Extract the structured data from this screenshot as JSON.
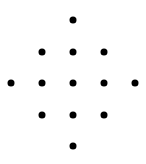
{
  "diagram": {
    "shape": "diamond dot pattern",
    "dot_color": "#000000",
    "background": "#ffffff",
    "dot_diameter": 7,
    "rows": [
      {
        "y": 20,
        "xs": [
          73
        ]
      },
      {
        "y": 52,
        "xs": [
          42,
          73,
          104
        ]
      },
      {
        "y": 83,
        "xs": [
          11,
          42,
          73,
          104,
          135
        ]
      },
      {
        "y": 115,
        "xs": [
          42,
          73,
          104
        ]
      },
      {
        "y": 146,
        "xs": [
          73
        ]
      }
    ],
    "dot_count": 13
  }
}
